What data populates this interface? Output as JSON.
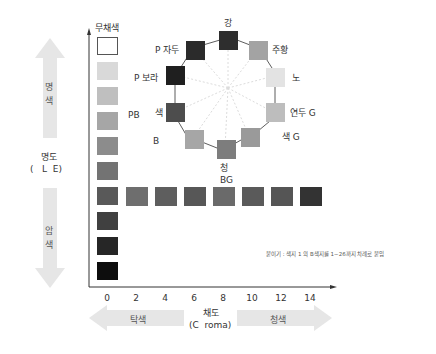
{
  "lightness_axis": {
    "label": "명도",
    "label_sub": "(   L  E)",
    "bright_arrow_label_1": "명",
    "bright_arrow_label_2": "색",
    "dark_arrow_label_1": "암",
    "dark_arrow_label_2": "색",
    "top_label": "무채색"
  },
  "chroma_axis": {
    "label": "채도",
    "label_sub": "(C  roma)",
    "left_arrow_label": "탁색",
    "right_arrow_label": "청색",
    "ticks": [
      "0",
      "2",
      "4",
      "6",
      "8",
      "10",
      "12",
      "14"
    ]
  },
  "gray_column": {
    "colors": [
      "#ffffff",
      "#d9d9d9",
      "#bfbfbf",
      "#a6a6a6",
      "#8c8c8c",
      "#737373",
      "#595959",
      "#404040",
      "#262626",
      "#0d0d0d"
    ]
  },
  "chroma_row": {
    "colors": [
      "#595959",
      "#6e6e6e",
      "#5e5e5e",
      "#575757",
      "#6a6a6a",
      "#5a5a5a",
      "#555555",
      "#333333"
    ]
  },
  "hue_circle": {
    "items": [
      {
        "label": "강",
        "color": "#2e2e2e"
      },
      {
        "label": "주황",
        "color": "#a3a3a3"
      },
      {
        "label": "노",
        "color": "#e3e3e3"
      },
      {
        "label": "연두 G",
        "color": "#bdbdbd"
      },
      {
        "label": "색 G",
        "color": "#9a9a9a"
      },
      {
        "label": "청",
        "label2": "BG",
        "color": "#7d7d7d"
      },
      {
        "label": "B",
        "color": "#a6a6a6"
      },
      {
        "label": "색",
        "label_left": "PB",
        "color": "#4d4d4d"
      },
      {
        "label": "P 보라",
        "color": "#1f1f1f"
      },
      {
        "label": "P 자두",
        "color": "#2b2b2b"
      }
    ]
  },
  "note": "붙이기 : 색지  1 의 B색지를 1~26까지 차례로 붙임"
}
